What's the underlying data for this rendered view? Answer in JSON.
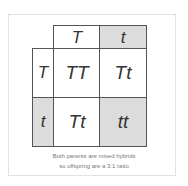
{
  "punnett": {
    "top_alleles": [
      "T",
      "t"
    ],
    "side_alleles": [
      "T",
      "t"
    ],
    "cells": [
      [
        "TT",
        "Tt"
      ],
      [
        "Tt",
        "tt"
      ]
    ]
  },
  "caption": {
    "line1": "Both parents are mixed hybrids",
    "line2": "so offspring are a 3:1 ratio"
  },
  "colors": {
    "shade": "#dcdcdc",
    "border": "#555555",
    "text": "#333333"
  }
}
